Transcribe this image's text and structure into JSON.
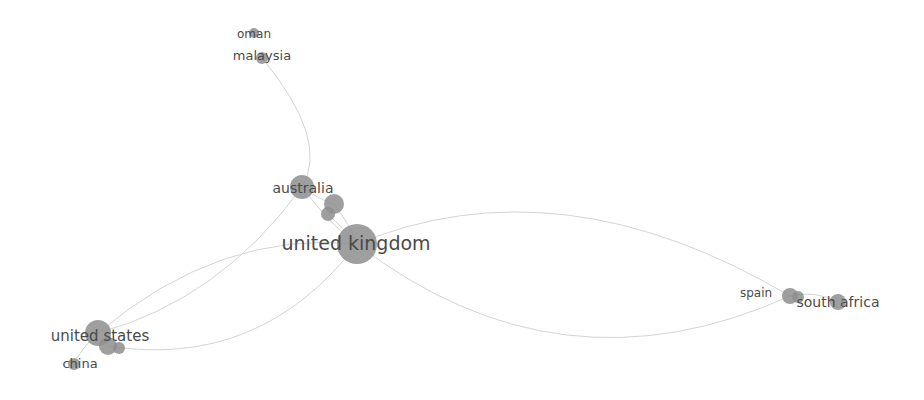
{
  "diagram": {
    "type": "network",
    "colors": {
      "node": "#8e8e8e",
      "edge": "#d4d4d4",
      "label": "#4a4a4a",
      "background": "#ffffff"
    },
    "nodes": [
      {
        "id": "oman",
        "label": "oman",
        "x": 254,
        "y": 33,
        "r": 5,
        "font": 12,
        "lx": 254,
        "ly": 38
      },
      {
        "id": "malaysia",
        "label": "malaysia",
        "x": 262,
        "y": 58,
        "r": 6,
        "font": 13,
        "lx": 262,
        "ly": 60
      },
      {
        "id": "australia",
        "label": "australia",
        "x": 302,
        "y": 187,
        "r": 12,
        "font": 14,
        "lx": 303,
        "ly": 193
      },
      {
        "id": "australia-sub1",
        "label": "",
        "x": 334,
        "y": 204,
        "r": 10,
        "font": 0
      },
      {
        "id": "australia-sub2",
        "label": "",
        "x": 328,
        "y": 214,
        "r": 7,
        "font": 0
      },
      {
        "id": "united-kingdom",
        "label": "united kingdom",
        "x": 357,
        "y": 244,
        "r": 20,
        "font": 19,
        "lx": 356,
        "ly": 250
      },
      {
        "id": "united-states",
        "label": "united states",
        "x": 98,
        "y": 333,
        "r": 13,
        "font": 15,
        "lx": 100,
        "ly": 341
      },
      {
        "id": "us-sub1",
        "label": "",
        "x": 108,
        "y": 346,
        "r": 9,
        "font": 0
      },
      {
        "id": "us-sub2",
        "label": "",
        "x": 119,
        "y": 348,
        "r": 6,
        "font": 0
      },
      {
        "id": "china",
        "label": "china",
        "x": 74,
        "y": 364,
        "r": 6,
        "font": 13,
        "lx": 80,
        "ly": 368
      },
      {
        "id": "spain",
        "label": "spain",
        "x": 790,
        "y": 296,
        "r": 8,
        "font": 12,
        "lx": 756,
        "ly": 297
      },
      {
        "id": "spain-sub",
        "label": "",
        "x": 798,
        "y": 297,
        "r": 6,
        "font": 0
      },
      {
        "id": "south-africa",
        "label": "south africa",
        "x": 838,
        "y": 302,
        "r": 8,
        "font": 14,
        "lx": 838,
        "ly": 307
      }
    ],
    "edges": [
      {
        "path": "M 262 58 Q 330 140 302 187"
      },
      {
        "path": "M 302 187 Q 330 225 357 244"
      },
      {
        "path": "M 302 187 Q 320 200 334 204"
      },
      {
        "path": "M 334 204 Q 350 225 357 244"
      },
      {
        "path": "M 328 214 Q 345 230 357 244"
      },
      {
        "path": "M 357 244 Q 220 230 98 333"
      },
      {
        "path": "M 302 187 Q 220 300 98 333"
      },
      {
        "path": "M 357 244 Q 260 370 108 346"
      },
      {
        "path": "M 357 244 Q 560 160 790 296"
      },
      {
        "path": "M 357 244 Q 560 400 790 296"
      },
      {
        "path": "M 790 296 Q 815 290 838 302"
      },
      {
        "path": "M 98 333 Q 80 350 74 364"
      }
    ]
  }
}
